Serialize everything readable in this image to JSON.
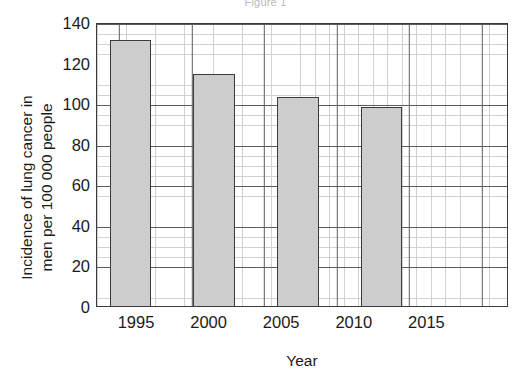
{
  "figure": {
    "caption": "Figure 1"
  },
  "axes": {
    "y_title_line1": "Incidence of lung cancer in",
    "y_title_line2": "men per 100 000 people",
    "x_title": "Year",
    "y_ticks": [
      "0",
      "20",
      "40",
      "60",
      "80",
      "100",
      "120",
      "140"
    ],
    "x_ticks": [
      "1995",
      "2000",
      "2005",
      "2010",
      "2015"
    ]
  },
  "colors": {
    "bar_fill": "#cdcdcd",
    "bar_border": "#3b3b3b",
    "frame": "#3a3a3a",
    "grid_major": "#5c5c5c",
    "grid_minor": "#c9c9c9",
    "text": "#1a1a1a",
    "caption": "#b9b9b9",
    "background": "#ffffff"
  },
  "chart_data": {
    "type": "bar",
    "title": "Figure 1",
    "xlabel": "Year",
    "ylabel": "Incidence of lung cancer in men per 100 000 people",
    "categories": [
      1995,
      2000,
      2005,
      2010,
      2015
    ],
    "values": [
      132,
      115,
      104,
      99,
      null
    ],
    "x": [
      1995,
      2000,
      2005,
      2010
    ],
    "xlim": [
      1993,
      2017.5
    ],
    "ylim": [
      0,
      140
    ],
    "y_major_step": 20,
    "y_minor_step": 5,
    "x_major_step": 5,
    "x_minor_step": 1,
    "grid": true,
    "legend": false,
    "bar_width_years": 2.5
  }
}
